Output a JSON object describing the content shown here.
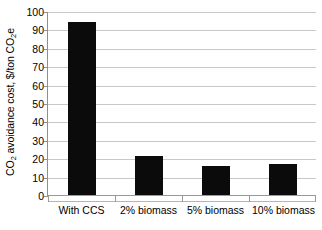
{
  "chart_data": {
    "type": "bar",
    "title": "",
    "xlabel": "",
    "ylabel": "CO2 avoidance cost, $/ton CO2e",
    "categories": [
      "With CCS",
      "2% biomass",
      "5% biomass",
      "10% biomass"
    ],
    "values": [
      94,
      21,
      16,
      17
    ],
    "ylim": [
      0,
      100
    ],
    "y_ticks": [
      0,
      10,
      20,
      30,
      40,
      50,
      60,
      70,
      80,
      90,
      100
    ],
    "grid": true,
    "legend": null,
    "bar_color": "#0b0b0b",
    "gridline_color": "#c8c8c8",
    "axis_color": "#8f8f8f",
    "background": "#ffffff"
  },
  "axis": {
    "y_title_main": "CO",
    "y_title_sub1": "2",
    "y_title_mid": " avoidance cost, $/ton CO",
    "y_title_sub2": "2",
    "y_title_end": "e",
    "tick_100": "100",
    "tick_90": "90",
    "tick_80": "80",
    "tick_70": "70",
    "tick_60": "60",
    "tick_50": "50",
    "tick_40": "40",
    "tick_30": "30",
    "tick_20": "20",
    "tick_10": "10",
    "tick_0": "0"
  },
  "categories": {
    "cat_0": "With CCS",
    "cat_1": "2% biomass",
    "cat_2": "5% biomass",
    "cat_3": "10% biomass"
  }
}
